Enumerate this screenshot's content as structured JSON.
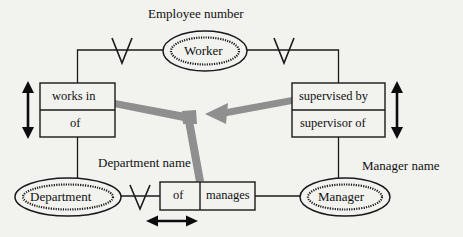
{
  "diagram": {
    "type": "entity-relationship",
    "colors": {
      "background": "#f2f2ef",
      "line": "#1a1a1a",
      "gray_arrow": "#8a8a8a",
      "text": "#111111"
    },
    "attributes": [
      {
        "id": "employee-number",
        "label": "Employee number",
        "x": 148,
        "y": 8
      },
      {
        "id": "department-name",
        "label": "Department name",
        "x": 98,
        "y": 157
      },
      {
        "id": "manager-name",
        "label": "Manager name",
        "x": 363,
        "y": 160
      }
    ],
    "entities": [
      {
        "id": "worker",
        "label": "Worker",
        "cx": 205,
        "cy": 51,
        "rx": 42,
        "ry": 20,
        "double": true
      },
      {
        "id": "department",
        "label": "Department",
        "cx": 68,
        "cy": 197,
        "rx": 53,
        "ry": 19,
        "double": true
      },
      {
        "id": "manager",
        "label": "Manager",
        "cx": 345,
        "cy": 197,
        "rx": 45,
        "ry": 19,
        "double": true
      }
    ],
    "relationship_boxes": [
      {
        "id": "works-in",
        "orientation": "vertical",
        "x": 40,
        "y": 83,
        "w": 75,
        "h": 54,
        "cells": [
          {
            "id": "works-in-top",
            "label": "works in"
          },
          {
            "id": "works-in-bottom",
            "label": "of"
          }
        ]
      },
      {
        "id": "supervised-by",
        "orientation": "vertical",
        "x": 292,
        "y": 83,
        "w": 93,
        "h": 54,
        "cells": [
          {
            "id": "supervised-by-top",
            "label": "supervised by"
          },
          {
            "id": "supervised-by-bottom",
            "label": "supervisor of"
          }
        ]
      },
      {
        "id": "manages",
        "orientation": "horizontal",
        "x": 160,
        "y": 182,
        "w": 95,
        "h": 28,
        "cells": [
          {
            "id": "manages-left",
            "label": "of"
          },
          {
            "id": "manages-right",
            "label": "manages"
          }
        ]
      }
    ],
    "cardinality_markers": [
      {
        "id": "crowsfoot-worker-left",
        "shape": "V",
        "cx": 122,
        "cy": 50
      },
      {
        "id": "crowsfoot-worker-right",
        "shape": "V",
        "cx": 284,
        "cy": 50
      },
      {
        "id": "crowsfoot-department",
        "shape": "V",
        "cx": 140,
        "cy": 196
      }
    ],
    "double_arrows": [
      {
        "id": "arrow-works-in-vertical",
        "direction": "vertical",
        "x": 28,
        "y1": 84,
        "y2": 136
      },
      {
        "id": "arrow-supervised-by-vertical",
        "direction": "vertical",
        "x": 397,
        "y1": 84,
        "y2": 136
      },
      {
        "id": "arrow-manages-horizontal",
        "direction": "horizontal",
        "y": 221,
        "x1": 148,
        "x2": 196
      }
    ],
    "gray_arrow": {
      "id": "inheritance-gray-arrow",
      "color": "#8a8a8a",
      "junction": {
        "x": 188,
        "y": 118
      },
      "arrowhead_direction": "left",
      "arrowhead": {
        "x": 208,
        "y": 111
      },
      "branches": [
        {
          "id": "branch-to-works-in",
          "from": "junction",
          "to": "works-in-box-right-edge"
        },
        {
          "id": "branch-to-supervised-by",
          "from": "supervised-by-box-left-edge",
          "to": "junction"
        },
        {
          "id": "branch-to-manages",
          "from": "junction",
          "to": "manages-box-top"
        }
      ]
    }
  }
}
